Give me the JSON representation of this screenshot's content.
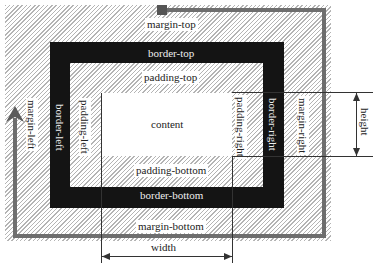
{
  "diagram": {
    "type": "css-box-model",
    "regions": {
      "margin": {
        "top": "margin-top",
        "right": "margin-right",
        "bottom": "margin-bottom",
        "left": "margin-left"
      },
      "border": {
        "top": "border-top",
        "right": "border-right",
        "bottom": "border-bottom",
        "left": "border-left"
      },
      "padding": {
        "top": "padding-top",
        "right": "padding-right",
        "bottom": "padding-bottom",
        "left": "padding-left"
      },
      "content": "content"
    },
    "dimensions": {
      "width": "width",
      "height": "height"
    },
    "colors": {
      "border": "#141414",
      "hatch": "#b4b4b4",
      "path": "#6e6e6e",
      "content": "#ffffff"
    }
  }
}
